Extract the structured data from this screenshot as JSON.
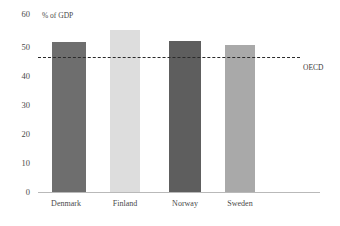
{
  "chart_data": {
    "type": "bar",
    "title": "",
    "ylabel": "% of GDP",
    "xlabel": "",
    "categories": [
      "Denmark",
      "Finland",
      "Norway",
      "Sweden"
    ],
    "values": [
      49.5,
      53.5,
      50.0,
      48.5
    ],
    "bar_colors": [
      "#6e6e6e",
      "#dddddd",
      "#5e5e5e",
      "#a9a9a9"
    ],
    "yticks": [
      0,
      10,
      20,
      30,
      40,
      50,
      60
    ],
    "ylim": [
      0,
      60
    ],
    "grid": false,
    "legend": "none",
    "annotations": [
      {
        "name": "oecd-reference-line",
        "label": "OECD",
        "value": 44.5,
        "style": "dashed",
        "color": "#2b2b2b"
      }
    ]
  },
  "axis": {
    "y_unit_label": "% of GDP",
    "tick_0": "0",
    "tick_10": "10",
    "tick_20": "20",
    "tick_30": "30",
    "tick_40": "40",
    "tick_50": "50",
    "tick_60": "60"
  },
  "bars": [
    {
      "label": "Denmark",
      "value": 49.5
    },
    {
      "label": "Finland",
      "value": 53.5
    },
    {
      "label": "Norway",
      "value": 50.0
    },
    {
      "label": "Sweden",
      "value": 48.5
    }
  ],
  "reference": {
    "label": "OECD",
    "value": 44.5
  },
  "title_ghost": ""
}
